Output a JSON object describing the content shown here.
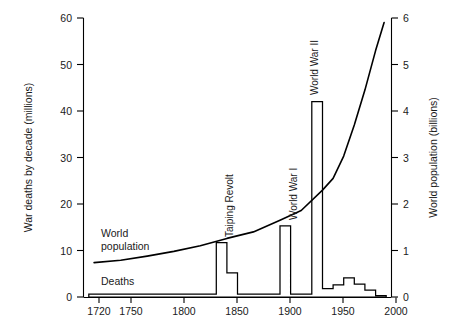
{
  "chart_data": {
    "type": "line",
    "title": "",
    "subtitle": "",
    "xlabel": "",
    "xlim": [
      1715,
      2005
    ],
    "x_ticks": [
      1720,
      1750,
      1800,
      1850,
      1900,
      1950,
      2000
    ],
    "x_tick_labels": [
      "1720",
      "1750",
      "1800",
      "1850",
      "1900",
      "1950",
      "2000"
    ],
    "grid": false,
    "legend_position": "inline-annotations",
    "left_axis": {
      "label": "War deaths by decade (millions)",
      "ylim": [
        0,
        60
      ],
      "ticks": [
        0,
        10,
        20,
        30,
        40,
        50,
        60
      ],
      "tick_labels": [
        "0",
        "10",
        "20",
        "30",
        "40",
        "50",
        "60"
      ]
    },
    "right_axis": {
      "label": "World population (billions)",
      "ylim": [
        0,
        6
      ],
      "ticks": [
        0,
        1,
        2,
        3,
        4,
        5,
        6
      ],
      "tick_labels": [
        "0",
        "1",
        "2",
        "3",
        "4",
        "5",
        "6"
      ]
    },
    "series": [
      {
        "name": "World population",
        "axis": "right",
        "type": "line",
        "units": "billions",
        "x": [
          1725,
          1750,
          1775,
          1800,
          1825,
          1850,
          1875,
          1900,
          1920,
          1940,
          1950,
          1960,
          1970,
          1980,
          1990,
          1998
        ],
        "values": [
          0.74,
          0.79,
          0.88,
          0.98,
          1.1,
          1.26,
          1.4,
          1.65,
          1.86,
          2.3,
          2.55,
          3.03,
          3.7,
          4.45,
          5.3,
          5.9
        ]
      },
      {
        "name": "Deaths",
        "axis": "left",
        "type": "step",
        "units": "millions",
        "decades": [
          1720,
          1730,
          1740,
          1750,
          1760,
          1770,
          1780,
          1790,
          1800,
          1810,
          1820,
          1830,
          1840,
          1850,
          1860,
          1870,
          1880,
          1890,
          1900,
          1910,
          1920,
          1930,
          1940,
          1950,
          1960,
          1970,
          1980,
          1990
        ],
        "values": [
          0.6,
          0.6,
          0.6,
          0.6,
          0.6,
          0.6,
          0.6,
          0.6,
          0.6,
          0.6,
          0.6,
          0.6,
          11.7,
          5.2,
          0.6,
          0.6,
          0.6,
          0.6,
          15.3,
          0.6,
          0.6,
          42.0,
          1.8,
          2.6,
          4.1,
          2.8,
          1.5,
          0.3
        ]
      }
    ],
    "annotations": [
      {
        "text": "Taiping Revolt",
        "x": 1851,
        "orientation": "vertical"
      },
      {
        "text": "World War I",
        "x": 1915,
        "orientation": "vertical"
      },
      {
        "text": "World War II",
        "x": 1938,
        "orientation": "vertical"
      },
      {
        "text": "World population",
        "x": 1740,
        "y_left": 13.5,
        "orientation": "horizontal"
      },
      {
        "text": "Deaths",
        "x": 1733,
        "y_left": 4.2,
        "orientation": "horizontal"
      }
    ],
    "colors": {
      "axis": "#000000",
      "population_line": "#000000",
      "deaths_line": "#000000",
      "background": "#ffffff"
    }
  },
  "labels": {
    "y_left_title": "War deaths by decade (millions)",
    "y_right_title": "World population (billions)",
    "y_left_0": "0",
    "y_left_10": "10",
    "y_left_20": "20",
    "y_left_30": "30",
    "y_left_40": "40",
    "y_left_50": "50",
    "y_left_60": "60",
    "y_right_0": "0",
    "y_right_1": "1",
    "y_right_2": "2",
    "y_right_3": "3",
    "y_right_4": "4",
    "y_right_5": "5",
    "y_right_6": "6",
    "x_1720": "1720",
    "x_1750": "1750",
    "x_1800": "1800",
    "x_1850": "1850",
    "x_1900": "1900",
    "x_1950": "1950",
    "x_2000": "2000",
    "annot_taiping": "Taiping Revolt",
    "annot_ww1": "World War I",
    "annot_ww2": "World War II",
    "series_population_line1": "World",
    "series_population_line2": "population",
    "series_deaths": "Deaths"
  }
}
